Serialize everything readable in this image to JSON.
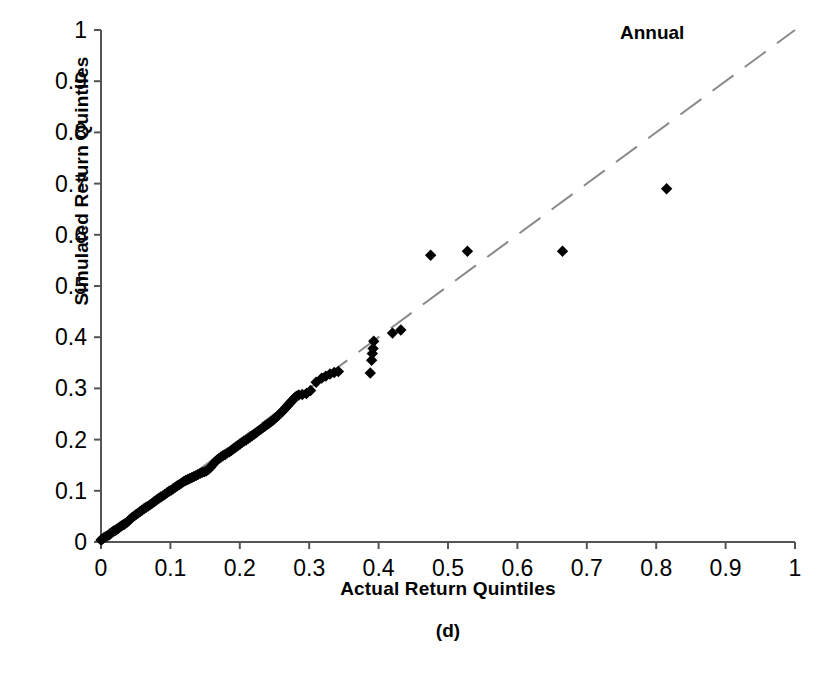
{
  "figure": {
    "caption": "(d)",
    "annotation": "Annual",
    "background_color": "#ffffff",
    "marker_color": "#000000",
    "reference_line_color": "#8a8a8a",
    "axis_color": "#555555"
  },
  "chart_data": {
    "type": "scatter",
    "title": "",
    "subtitle": "",
    "annotation": "Annual",
    "caption": "(d)",
    "xlabel": "Actual Return Quintiles",
    "ylabel": "Simulated Return Quintiles",
    "xlim": [
      0,
      1
    ],
    "ylim": [
      0,
      1
    ],
    "xticks": [
      0,
      0.1,
      0.2,
      0.3,
      0.4,
      0.5,
      0.6,
      0.7,
      0.8,
      0.9,
      1
    ],
    "yticks": [
      0,
      0.1,
      0.2,
      0.3,
      0.4,
      0.5,
      0.6,
      0.7,
      0.8,
      0.9,
      1
    ],
    "xtick_labels": [
      "0",
      "0.1",
      "0.2",
      "0.3",
      "0.4",
      "0.5",
      "0.6",
      "0.7",
      "0.8",
      "0.9",
      "1"
    ],
    "ytick_labels": [
      "0",
      "0.1",
      "0.2",
      "0.3",
      "0.4",
      "0.5",
      "0.6",
      "0.7",
      "0.8",
      "0.9",
      "1"
    ],
    "grid": false,
    "legend": null,
    "marker": "diamond",
    "marker_size": 7,
    "reference_line": {
      "label": "45-degree identity line",
      "style": "dashed",
      "color": "#8a8a8a",
      "from": [
        0,
        0
      ],
      "to": [
        1,
        1
      ]
    },
    "series": [
      {
        "name": "Annual",
        "points": [
          [
            0.0,
            0.004
          ],
          [
            0.002,
            0.006
          ],
          [
            0.004,
            0.008
          ],
          [
            0.006,
            0.01
          ],
          [
            0.008,
            0.011
          ],
          [
            0.01,
            0.013
          ],
          [
            0.012,
            0.014
          ],
          [
            0.013,
            0.016
          ],
          [
            0.015,
            0.018
          ],
          [
            0.017,
            0.02
          ],
          [
            0.019,
            0.022
          ],
          [
            0.021,
            0.023
          ],
          [
            0.023,
            0.025
          ],
          [
            0.025,
            0.027
          ],
          [
            0.027,
            0.029
          ],
          [
            0.029,
            0.031
          ],
          [
            0.031,
            0.033
          ],
          [
            0.033,
            0.034
          ],
          [
            0.035,
            0.036
          ],
          [
            0.038,
            0.039
          ],
          [
            0.041,
            0.043
          ],
          [
            0.044,
            0.047
          ],
          [
            0.047,
            0.05
          ],
          [
            0.05,
            0.053
          ],
          [
            0.053,
            0.056
          ],
          [
            0.056,
            0.059
          ],
          [
            0.059,
            0.062
          ],
          [
            0.062,
            0.065
          ],
          [
            0.065,
            0.068
          ],
          [
            0.068,
            0.07
          ],
          [
            0.071,
            0.073
          ],
          [
            0.074,
            0.076
          ],
          [
            0.077,
            0.079
          ],
          [
            0.08,
            0.082
          ],
          [
            0.083,
            0.085
          ],
          [
            0.086,
            0.088
          ],
          [
            0.089,
            0.09
          ],
          [
            0.092,
            0.093
          ],
          [
            0.095,
            0.096
          ],
          [
            0.098,
            0.099
          ],
          [
            0.101,
            0.101
          ],
          [
            0.104,
            0.104
          ],
          [
            0.107,
            0.107
          ],
          [
            0.11,
            0.11
          ],
          [
            0.113,
            0.112
          ],
          [
            0.116,
            0.115
          ],
          [
            0.119,
            0.118
          ],
          [
            0.122,
            0.12
          ],
          [
            0.125,
            0.122
          ],
          [
            0.128,
            0.124
          ],
          [
            0.131,
            0.126
          ],
          [
            0.134,
            0.128
          ],
          [
            0.137,
            0.13
          ],
          [
            0.14,
            0.132
          ],
          [
            0.143,
            0.134
          ],
          [
            0.146,
            0.136
          ],
          [
            0.149,
            0.137
          ],
          [
            0.152,
            0.139
          ],
          [
            0.155,
            0.142
          ],
          [
            0.158,
            0.146
          ],
          [
            0.161,
            0.151
          ],
          [
            0.164,
            0.156
          ],
          [
            0.167,
            0.16
          ],
          [
            0.17,
            0.163
          ],
          [
            0.173,
            0.166
          ],
          [
            0.176,
            0.169
          ],
          [
            0.179,
            0.171
          ],
          [
            0.182,
            0.174
          ],
          [
            0.185,
            0.176
          ],
          [
            0.188,
            0.179
          ],
          [
            0.191,
            0.182
          ],
          [
            0.194,
            0.185
          ],
          [
            0.197,
            0.188
          ],
          [
            0.2,
            0.191
          ],
          [
            0.203,
            0.194
          ],
          [
            0.206,
            0.197
          ],
          [
            0.209,
            0.199
          ],
          [
            0.212,
            0.202
          ],
          [
            0.215,
            0.205
          ],
          [
            0.218,
            0.208
          ],
          [
            0.221,
            0.211
          ],
          [
            0.224,
            0.214
          ],
          [
            0.227,
            0.217
          ],
          [
            0.23,
            0.22
          ],
          [
            0.233,
            0.223
          ],
          [
            0.236,
            0.226
          ],
          [
            0.239,
            0.229
          ],
          [
            0.242,
            0.232
          ],
          [
            0.245,
            0.235
          ],
          [
            0.248,
            0.238
          ],
          [
            0.25,
            0.241
          ],
          [
            0.253,
            0.244
          ],
          [
            0.256,
            0.248
          ],
          [
            0.259,
            0.252
          ],
          [
            0.262,
            0.256
          ],
          [
            0.264,
            0.259
          ],
          [
            0.266,
            0.262
          ],
          [
            0.268,
            0.265
          ],
          [
            0.27,
            0.268
          ],
          [
            0.272,
            0.271
          ],
          [
            0.274,
            0.274
          ],
          [
            0.276,
            0.277
          ],
          [
            0.278,
            0.28
          ],
          [
            0.28,
            0.283
          ],
          [
            0.282,
            0.285
          ],
          [
            0.285,
            0.287
          ],
          [
            0.29,
            0.288
          ],
          [
            0.296,
            0.29
          ],
          [
            0.302,
            0.296
          ],
          [
            0.31,
            0.312
          ],
          [
            0.318,
            0.32
          ],
          [
            0.324,
            0.324
          ],
          [
            0.33,
            0.328
          ],
          [
            0.336,
            0.331
          ],
          [
            0.342,
            0.333
          ],
          [
            0.388,
            0.33
          ],
          [
            0.39,
            0.355
          ],
          [
            0.391,
            0.368
          ],
          [
            0.392,
            0.378
          ],
          [
            0.393,
            0.392
          ],
          [
            0.42,
            0.408
          ],
          [
            0.432,
            0.414
          ],
          [
            0.475,
            0.56
          ],
          [
            0.528,
            0.568
          ],
          [
            0.665,
            0.568
          ],
          [
            0.815,
            0.69
          ]
        ]
      }
    ]
  },
  "axes": {
    "xlabel": "Actual Return Quintiles",
    "ylabel": "Simulated Return Quintiles"
  }
}
